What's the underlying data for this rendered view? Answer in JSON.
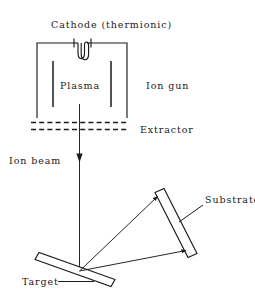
{
  "figure": {
    "labels": {
      "cathode": "Cathode (thermionic)",
      "plasma": "Plasma",
      "ion_gun": "Ion gun",
      "extractor": "Extractor",
      "ion_beam": "Ion beam",
      "substrate": "Substrate",
      "target": "Target"
    },
    "colors": {
      "ink": "#1a1a1a",
      "background": "#ffffff"
    },
    "components": [
      {
        "name": "ion-gun-chamber",
        "kind": "open-bottom-box",
        "description": "Rectangular chamber wall, open at bottom, enclosing the plasma region"
      },
      {
        "name": "cathode-filament",
        "kind": "coil",
        "description": "Thermionic filament coil suspended from the chamber top wall with two terminal tick marks"
      },
      {
        "name": "anode-bar-left",
        "kind": "vertical-bar",
        "description": "Inner electrode bar on the left side of the plasma region"
      },
      {
        "name": "anode-bar-right",
        "kind": "vertical-bar",
        "description": "Inner electrode bar on the right side of the plasma region"
      },
      {
        "name": "extractor-grid-upper",
        "kind": "dashed-line",
        "description": "Upper dashed extraction grid below the chamber"
      },
      {
        "name": "extractor-grid-lower",
        "kind": "dashed-line",
        "description": "Lower dashed extraction grid below the chamber"
      },
      {
        "name": "ion-beam-arrow",
        "kind": "vertical-arrow",
        "description": "Vertical ion beam travelling downward from the extractor to the target"
      },
      {
        "name": "target-plate",
        "kind": "tilted-plate",
        "description": "Thin plate tilted about 20 degrees below horizontal, struck by the ion beam"
      },
      {
        "name": "substrate-plate",
        "kind": "tilted-plate",
        "description": "Thin plate tilted about 17 degrees from vertical, receiving sputtered material"
      },
      {
        "name": "sputter-arrow-upper",
        "kind": "arrow",
        "description": "Sputtered flux from the target impact point to the upper end of the substrate"
      },
      {
        "name": "sputter-arrow-lower",
        "kind": "arrow",
        "description": "Sputtered flux from the target impact point to the lower end of the substrate"
      }
    ]
  }
}
